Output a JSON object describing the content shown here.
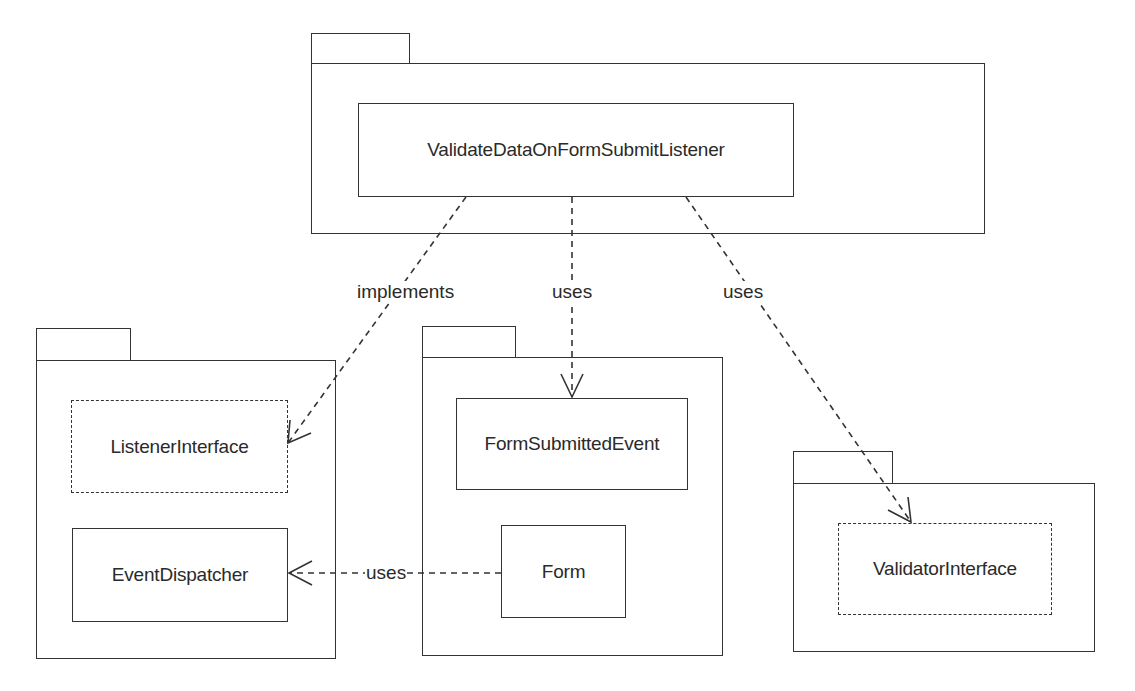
{
  "diagram": {
    "type": "uml-package-diagram",
    "packages": [
      {
        "id": "top",
        "classes": [
          {
            "name": "ValidateDataOnFormSubmitListener",
            "kind": "class"
          }
        ]
      },
      {
        "id": "left",
        "classes": [
          {
            "name": "ListenerInterface",
            "kind": "interface"
          },
          {
            "name": "EventDispatcher",
            "kind": "class"
          }
        ]
      },
      {
        "id": "middle",
        "classes": [
          {
            "name": "FormSubmittedEvent",
            "kind": "class"
          },
          {
            "name": "Form",
            "kind": "class"
          }
        ]
      },
      {
        "id": "right",
        "classes": [
          {
            "name": "ValidatorInterface",
            "kind": "interface"
          }
        ]
      }
    ],
    "relations": [
      {
        "from": "ValidateDataOnFormSubmitListener",
        "to": "ListenerInterface",
        "label": "implements"
      },
      {
        "from": "ValidateDataOnFormSubmitListener",
        "to": "FormSubmittedEvent",
        "label": "uses"
      },
      {
        "from": "ValidateDataOnFormSubmitListener",
        "to": "ValidatorInterface",
        "label": "uses"
      },
      {
        "from": "Form",
        "to": "EventDispatcher",
        "label": "uses"
      }
    ],
    "colors": {
      "line": "#333333",
      "text": "#2a2a2a",
      "background": "#ffffff"
    }
  }
}
